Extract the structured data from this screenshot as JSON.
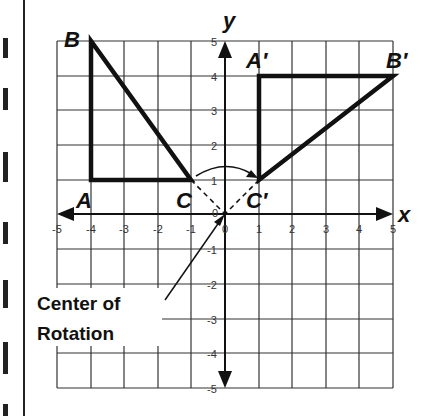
{
  "diagram": {
    "axes": {
      "x_label": "x",
      "y_label": "y",
      "x_ticks": [
        "-5",
        "-4",
        "-3",
        "-2",
        "-1",
        "0",
        "1",
        "2",
        "3",
        "4",
        "5"
      ],
      "y_ticks": [
        "5",
        "4",
        "3",
        "2",
        "1",
        "-1",
        "-2",
        "-3",
        "-4",
        "-5"
      ],
      "origin_label": "0",
      "range": [
        -5,
        5
      ]
    },
    "original_triangle": {
      "vertices": [
        {
          "label": "A",
          "x": -4,
          "y": 1
        },
        {
          "label": "B",
          "x": -4,
          "y": 5
        },
        {
          "label": "C",
          "x": -1,
          "y": 1
        }
      ]
    },
    "image_triangle": {
      "vertices": [
        {
          "label": "A′",
          "x": 1,
          "y": 4
        },
        {
          "label": "B′",
          "x": 5,
          "y": 4
        },
        {
          "label": "C′",
          "x": 1,
          "y": 1
        }
      ]
    },
    "annotation": {
      "line1": "Center of",
      "line2": "Rotation"
    }
  }
}
